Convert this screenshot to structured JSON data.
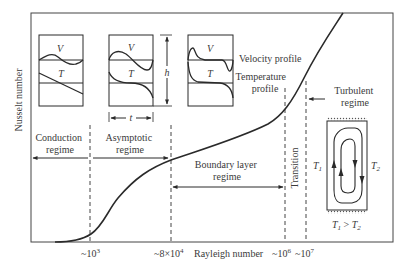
{
  "figure": {
    "y_axis_label": "Nusselt number",
    "x_axis_label": "Rayleigh number",
    "x_ticks": [
      {
        "label": "~10",
        "exp": "3"
      },
      {
        "label": "~8×10",
        "exp": "4"
      },
      {
        "label": "~10",
        "exp": "6"
      },
      {
        "label": "~10",
        "exp": "7"
      }
    ],
    "regimes": {
      "conduction": [
        "Conduction",
        "regime"
      ],
      "asymptotic": [
        "Asymptotic",
        "regime"
      ],
      "boundary_layer": [
        "Boundary layer",
        "regime"
      ],
      "transition": "Transition",
      "turbulent": [
        "Turbulent",
        "regime"
      ]
    },
    "profiles": {
      "velocity_symbol": "V",
      "temperature_symbol": "T",
      "velocity_label": "Velocity profile",
      "temperature_label": [
        "Temperature",
        "profile"
      ],
      "height_symbol": "h",
      "thickness_symbol": "t"
    },
    "cell": {
      "left_temp": "T",
      "left_sub": "1",
      "right_temp": "T",
      "right_sub": "2",
      "condition_a": "T",
      "condition_a_sub": "1",
      "condition_op": " > ",
      "condition_b": "T",
      "condition_b_sub": "2"
    },
    "colors": {
      "line": "#2a2a2a",
      "text": "#3a3a3a",
      "frame": "#444444"
    }
  }
}
